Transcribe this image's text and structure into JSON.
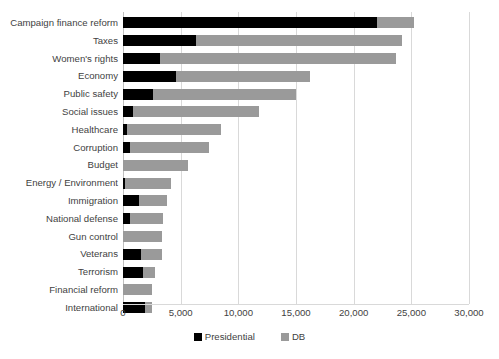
{
  "chart_data": {
    "type": "bar",
    "orientation": "horizontal",
    "stacked": true,
    "title": "",
    "subtitle": "",
    "xlabel": "",
    "ylabel": "",
    "xlim": [
      0,
      30000
    ],
    "grid": true,
    "legend_position": "bottom",
    "tick_labels": [
      "0",
      "5,000",
      "10,000",
      "15,000",
      "20,000",
      "25,000",
      "30,000"
    ],
    "tick_values": [
      0,
      5000,
      10000,
      15000,
      20000,
      25000,
      30000
    ],
    "categories": [
      "Campaign finance reform",
      "Taxes",
      "Women's rights",
      "Economy",
      "Public safety",
      "Social issues",
      "Healthcare",
      "Corruption",
      "Budget",
      "Energy / Environment",
      "Immigration",
      "National defense",
      "Gun control",
      "Veterans",
      "Terrorism",
      "Financial reform",
      "International"
    ],
    "series": [
      {
        "name": "Presidential",
        "color": "#000000",
        "values": [
          22000,
          6300,
          3200,
          4600,
          2600,
          900,
          350,
          600,
          0,
          200,
          1400,
          600,
          0,
          1550,
          1700,
          0,
          1900
        ]
      },
      {
        "name": "DB",
        "color": "#9a9a9a",
        "values": [
          3200,
          17900,
          20500,
          11600,
          12400,
          10900,
          8150,
          6900,
          5600,
          4000,
          2400,
          2900,
          3400,
          1850,
          1050,
          2500,
          600
        ]
      }
    ],
    "totals": [
      25200,
      24200,
      23700,
      16200,
      15000,
      11800,
      8500,
      7500,
      5600,
      4200,
      3800,
      3500,
      3400,
      3400,
      2750,
      2500,
      2500
    ]
  },
  "legend": {
    "items": [
      {
        "label": "Presidential",
        "swatch": "presidential"
      },
      {
        "label": "DB",
        "swatch": "db"
      }
    ]
  }
}
